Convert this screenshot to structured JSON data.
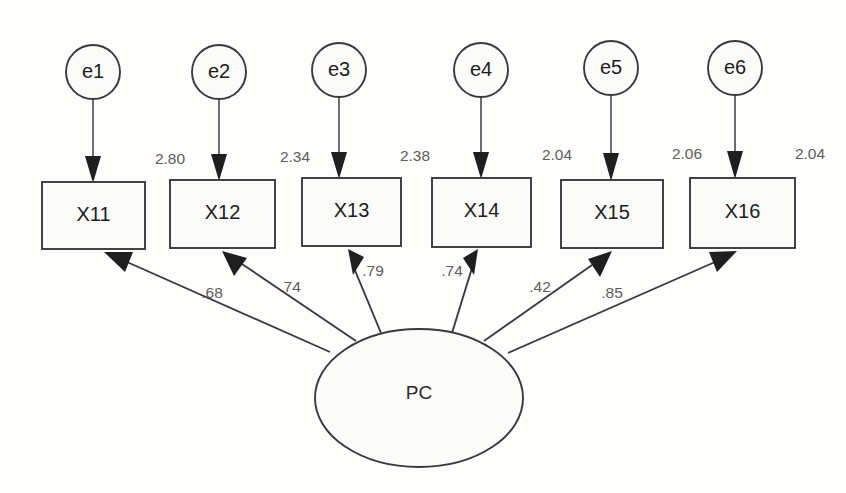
{
  "diagram": {
    "type": "sem-path-diagram",
    "factor": {
      "name": "PC",
      "shape": "ellipse",
      "cx": 419,
      "cy": 398,
      "rx": 104,
      "ry": 69
    },
    "errors": [
      {
        "label": "e1",
        "cx": 93,
        "cy": 72
      },
      {
        "label": "e2",
        "cx": 218,
        "cy": 72
      },
      {
        "label": "e3",
        "cx": 339,
        "cy": 70
      },
      {
        "label": "e4",
        "cx": 481,
        "cy": 70
      },
      {
        "label": "e5",
        "cx": 611,
        "cy": 68
      },
      {
        "label": "e6",
        "cx": 735,
        "cy": 68
      }
    ],
    "error_radius": 27,
    "indicators": [
      {
        "label": "X11",
        "x": 42,
        "y": 182,
        "w": 103,
        "h": 67
      },
      {
        "label": "X12",
        "x": 170,
        "y": 180,
        "w": 105,
        "h": 68
      },
      {
        "label": "X13",
        "x": 302,
        "y": 178,
        "w": 99,
        "h": 68
      },
      {
        "label": "X14",
        "x": 432,
        "y": 178,
        "w": 99,
        "h": 69
      },
      {
        "label": "X15",
        "x": 561,
        "y": 180,
        "w": 102,
        "h": 68
      },
      {
        "label": "X16",
        "x": 690,
        "y": 178,
        "w": 105,
        "h": 70
      }
    ],
    "error_variances": [
      {
        "value": "2.80",
        "x": 170,
        "y": 160
      },
      {
        "value": "2.34",
        "x": 295,
        "y": 158
      },
      {
        "value": "2.38",
        "x": 415,
        "y": 157
      },
      {
        "value": "2.04",
        "x": 557,
        "y": 156
      },
      {
        "value": "2.06",
        "x": 687,
        "y": 155
      },
      {
        "value": "2.04",
        "x": 810,
        "y": 155
      }
    ],
    "loadings": [
      {
        "value": ".68",
        "x": 212,
        "y": 294,
        "target": "X11"
      },
      {
        "value": ".74",
        "x": 290,
        "y": 288,
        "target": "X12"
      },
      {
        "value": ".79",
        "x": 373,
        "y": 272,
        "target": "X13"
      },
      {
        "value": ".74",
        "x": 452,
        "y": 272,
        "target": "X14"
      },
      {
        "value": ".42",
        "x": 540,
        "y": 288,
        "target": "X15"
      },
      {
        "value": ".85",
        "x": 612,
        "y": 294,
        "target": "X16"
      }
    ],
    "colors": {
      "stroke": "#3a3a3a",
      "fill": "#fbfbfa",
      "text": "#1c1c1c",
      "param_text": "#5d5d5d",
      "background": "#fdfdfc"
    }
  }
}
